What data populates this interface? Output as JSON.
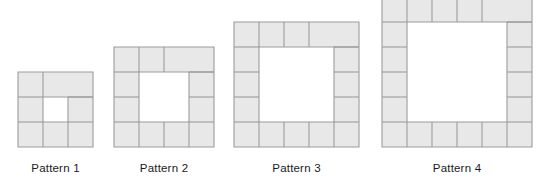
{
  "figure": {
    "kind": "growing-pattern-sequence",
    "background_color": "#ffffff",
    "tile_fill_color": "#e8e8e8",
    "tile_stroke_color": "#9c9c9c",
    "hole_fill_color": "#ffffff",
    "label_color": "#1a1a1a",
    "cell_size_px": 25,
    "baseline_y_px": 155
  },
  "patterns": [
    {
      "label": "Pattern 1",
      "index": 1,
      "outer_side_cells": 3,
      "hole_side_cells": 1,
      "tile_count": 8,
      "left_px": 18,
      "top_px": 72,
      "width_px": 75,
      "height_px": 75,
      "cropped_at_top": false,
      "caption_left_px": 18,
      "caption_top_px": 162,
      "tiles": [
        {
          "x": 0,
          "y": 0,
          "w": 2,
          "h": 1
        },
        {
          "x": 2,
          "y": 0,
          "w": 1,
          "h": 2
        },
        {
          "x": 1,
          "y": 2,
          "w": 2,
          "h": 1
        },
        {
          "x": 0,
          "y": 1,
          "w": 1,
          "h": 2
        }
      ],
      "subdivisions": [
        {
          "x": 1,
          "y": 0,
          "orientation": "vertical"
        },
        {
          "x": 2,
          "y": 1,
          "orientation": "horizontal"
        },
        {
          "x": 1,
          "y": 2,
          "orientation": "vertical"
        },
        {
          "x": 0,
          "y": 1,
          "orientation": "horizontal"
        }
      ],
      "hole": {
        "x": 1,
        "y": 1,
        "w": 1,
        "h": 1
      }
    },
    {
      "label": "Pattern 2",
      "index": 2,
      "outer_side_cells": 4,
      "hole_side_cells": 2,
      "tile_count": 12,
      "left_px": 114,
      "top_px": 47,
      "width_px": 100,
      "height_px": 100,
      "cropped_at_top": false,
      "caption_left_px": 114,
      "caption_top_px": 162,
      "hole": {
        "x": 1,
        "y": 1,
        "w": 2,
        "h": 2
      }
    },
    {
      "label": "Pattern 3",
      "index": 3,
      "outer_side_cells": 5,
      "hole_side_cells": 3,
      "tile_count": 16,
      "left_px": 234,
      "top_px": 22,
      "width_px": 125,
      "height_px": 125,
      "cropped_at_top": false,
      "caption_left_px": 234,
      "caption_top_px": 162,
      "hole": {
        "x": 1,
        "y": 1,
        "w": 3,
        "h": 3
      }
    },
    {
      "label": "Pattern 4",
      "index": 4,
      "outer_side_cells": 6,
      "hole_side_cells": 4,
      "tile_count": 20,
      "left_px": 382,
      "top_px": -3,
      "width_px": 150,
      "height_px": 150,
      "cropped_at_top": true,
      "caption_left_px": 382,
      "caption_top_px": 162,
      "hole": {
        "x": 1,
        "y": 1,
        "w": 4,
        "h": 4
      }
    }
  ]
}
